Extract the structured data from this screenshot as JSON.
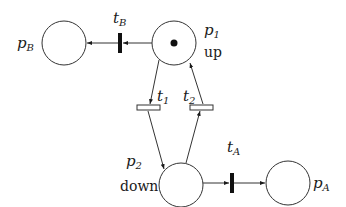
{
  "diagram": {
    "type": "petri-net",
    "places": [
      {
        "id": "p1",
        "label": "p",
        "sub": "1",
        "caption": "up",
        "tokens": 1,
        "cx": 174,
        "cy": 43,
        "r": 22
      },
      {
        "id": "p2",
        "label": "p",
        "sub": "2",
        "caption": "down",
        "tokens": 0,
        "cx": 181,
        "cy": 185,
        "r": 22
      },
      {
        "id": "pB",
        "label": "p",
        "sub": "B",
        "caption": "",
        "tokens": 0,
        "cx": 64,
        "cy": 43,
        "r": 22
      },
      {
        "id": "pA",
        "label": "p",
        "sub": "A",
        "caption": "",
        "tokens": 0,
        "cx": 288,
        "cy": 183,
        "r": 22
      }
    ],
    "transitions": [
      {
        "id": "tB",
        "label": "t",
        "sub": "B",
        "kind": "immediate"
      },
      {
        "id": "tA",
        "label": "t",
        "sub": "A",
        "kind": "immediate"
      },
      {
        "id": "t1",
        "label": "t",
        "sub": "1",
        "kind": "timed"
      },
      {
        "id": "t2",
        "label": "t",
        "sub": "2",
        "kind": "timed"
      }
    ],
    "arcs": [
      {
        "from": "p1",
        "to": "tB"
      },
      {
        "from": "tB",
        "to": "pB"
      },
      {
        "from": "p1",
        "to": "t1"
      },
      {
        "from": "t1",
        "to": "p2"
      },
      {
        "from": "p2",
        "to": "t2"
      },
      {
        "from": "t2",
        "to": "p1"
      },
      {
        "from": "p2",
        "to": "tA"
      },
      {
        "from": "tA",
        "to": "pA"
      }
    ]
  }
}
